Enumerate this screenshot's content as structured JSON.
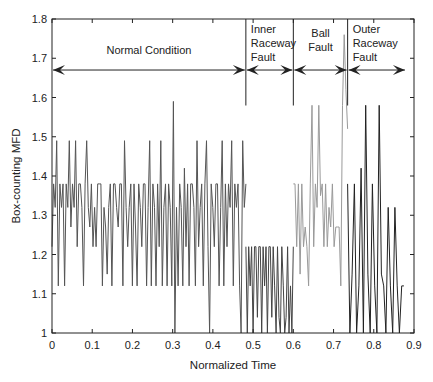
{
  "chart_data": {
    "type": "line",
    "title": "",
    "xlabel": "Normalized Time",
    "ylabel": "Box-counting MFD",
    "xlim": [
      0,
      0.9
    ],
    "ylim": [
      1,
      1.8
    ],
    "xticks": [
      "0",
      "0.1",
      "0.2",
      "0.3",
      "0.4",
      "0.5",
      "0.6",
      "0.7",
      "0.8",
      "0.9"
    ],
    "yticks": [
      "1",
      "1.1",
      "1.2",
      "1.3",
      "1.4",
      "1.5",
      "1.6",
      "1.7",
      "1.8"
    ],
    "grid": false,
    "regions": [
      {
        "label": [
          "Normal Condition"
        ],
        "x_start": 0.0,
        "x_end": 0.482
      },
      {
        "label": [
          "Inner",
          "Raceway",
          "Fault"
        ],
        "x_start": 0.482,
        "x_end": 0.6
      },
      {
        "label": [
          "Ball",
          "Fault"
        ],
        "x_start": 0.6,
        "x_end": 0.735
      },
      {
        "label": [
          "Outer",
          "Raceway",
          "Fault"
        ],
        "x_start": 0.735,
        "x_end": 0.88
      }
    ],
    "dividers_x": [
      0.482,
      0.6,
      0.735
    ],
    "arrow_y": 1.67,
    "series": [
      {
        "name": "Normal Condition",
        "color": "#555555",
        "x_start": 0.0,
        "x_end": 0.482,
        "values": [
          1.22,
          1.38,
          1.32,
          1.49,
          1.12,
          1.38,
          1.32,
          1.38,
          1.12,
          1.38,
          1.32,
          1.49,
          1.27,
          1.38,
          1.32,
          1.49,
          1.22,
          1.38,
          1.38,
          1.32,
          1.12,
          1.38,
          1.49,
          1.32,
          1.27,
          1.38,
          1.22,
          1.32,
          1.22,
          1.38,
          1.38,
          1.38,
          1.12,
          1.32,
          1.27,
          1.15,
          1.32,
          1.38,
          1.12,
          1.38,
          1.38,
          1.32,
          1.27,
          1.38,
          1.38,
          1.12,
          1.49,
          1.32,
          1.22,
          1.32,
          1.38,
          1.12,
          1.38,
          1.27,
          1.12,
          1.38,
          1.32,
          1.22,
          1.38,
          1.38,
          1.12,
          1.32,
          1.49,
          1.12,
          1.38,
          1.32,
          1.12,
          1.38,
          1.22,
          1.49,
          1.12,
          1.32,
          1.38,
          1.12,
          1.38,
          1.32,
          1.12,
          1.59,
          1.0,
          1.32,
          1.12,
          1.38,
          1.32,
          1.12,
          1.42,
          1.22,
          1.38,
          1.12,
          1.38,
          1.38,
          1.32,
          1.12,
          1.49,
          1.22,
          1.32,
          1.38,
          1.12,
          1.38,
          1.49,
          1.22,
          1.0,
          1.38,
          1.32,
          1.22,
          1.38,
          1.38,
          1.12,
          1.32,
          1.49,
          1.12,
          1.38,
          1.22,
          1.38,
          1.32,
          1.49,
          1.12,
          1.38,
          1.32,
          1.38,
          1.12,
          1.0,
          1.49,
          1.32,
          1.38
        ]
      },
      {
        "name": "Inner Raceway Fault",
        "color": "#444444",
        "x_start": 0.482,
        "x_end": 0.6,
        "values": [
          1.22,
          1.0,
          1.22,
          1.12,
          1.22,
          1.0,
          1.22,
          1.22,
          1.04,
          1.22,
          1.22,
          1.0,
          1.22,
          1.12,
          1.22,
          1.0,
          1.22,
          1.22,
          1.04,
          1.22,
          1.12,
          1.0,
          1.22,
          1.04,
          1.0,
          1.22,
          1.12,
          1.0,
          1.04,
          1.22,
          1.0,
          1.12,
          1.0,
          1.22
        ]
      },
      {
        "name": "Ball Fault",
        "color": "#9a9a9a",
        "x_start": 0.6,
        "x_end": 0.735,
        "values": [
          1.38,
          1.38,
          1.22,
          1.38,
          1.15,
          1.38,
          1.22,
          1.27,
          1.22,
          1.12,
          1.38,
          1.58,
          1.22,
          1.38,
          1.32,
          1.58,
          1.35,
          1.38,
          1.22,
          1.38,
          1.22,
          1.32,
          1.27,
          1.38,
          1.22,
          1.27,
          1.27,
          1.27,
          1.12,
          1.58,
          1.76,
          1.62,
          1.52
        ]
      },
      {
        "name": "Outer Raceway Fault",
        "color": "#222222",
        "x_start": 0.735,
        "x_end": 0.875,
        "values": [
          1.38,
          1.0,
          1.15,
          1.38,
          1.0,
          1.12,
          1.42,
          1.0,
          1.58,
          1.15,
          1.0,
          1.38,
          1.12,
          1.0,
          1.58,
          1.15,
          1.12,
          1.0,
          1.32,
          1.12,
          1.0,
          1.32,
          1.12,
          1.0,
          1.12,
          1.12
        ]
      }
    ]
  }
}
